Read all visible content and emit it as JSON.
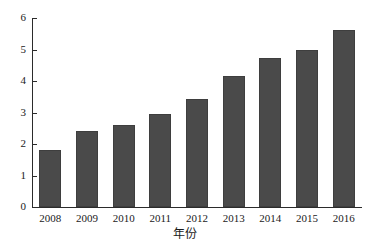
{
  "chart_data": {
    "type": "bar",
    "title": "",
    "xlabel": "年份",
    "ylabel": "",
    "categories": [
      "2008",
      "2009",
      "2010",
      "2011",
      "2012",
      "2013",
      "2014",
      "2015",
      "2016"
    ],
    "values": [
      1.8,
      2.41,
      2.6,
      2.95,
      3.43,
      4.16,
      4.73,
      4.98,
      5.62
    ],
    "ylim": [
      0,
      6
    ],
    "yticks": [
      0,
      1,
      2,
      3,
      4,
      5,
      6
    ],
    "ytick_labels": [
      "0",
      "1",
      "2",
      "3",
      "4",
      "5",
      "6"
    ],
    "grid": false,
    "legend": null,
    "bar_color": "#4a4a4a",
    "axis_color": "#2b2b2b",
    "background_color": "#ffffff"
  }
}
